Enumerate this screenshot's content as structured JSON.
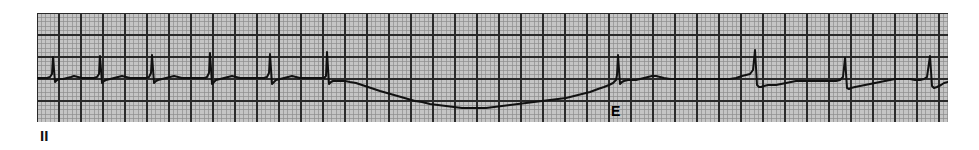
{
  "strip": {
    "lead_label": "II",
    "lead_label_x": 40,
    "lead_label_y": 128,
    "lead_label_size": 15,
    "width": 979,
    "height": 150,
    "background": "#ffffff"
  },
  "paper": {
    "x": 37,
    "y": 13,
    "width": 911,
    "height": 109,
    "paper_color": "#c5c5c5",
    "fine_line_color": "#8d8d8d",
    "heavy_line_color": "#2a2a2a",
    "fine_spacing": 4.4,
    "heavy_spacing": 22.0,
    "fine_line_width": 0.7,
    "heavy_line_width": 1.6,
    "trace_color": "#111111",
    "trace_width": 2.0
  },
  "annotations": [
    {
      "label": "E",
      "x": 611,
      "y": 104,
      "size": 14,
      "meaning": "escape-beat"
    }
  ],
  "chart_data": {
    "type": "line",
    "title": "",
    "xlabel": "",
    "ylabel": "",
    "lead": "II",
    "grid": true,
    "legend": "none",
    "paper_speed": "25 mm/s",
    "gain": "10 mm/mV",
    "xlim": [
      37,
      948
    ],
    "ylim": [
      13,
      122
    ],
    "baseline_y": 78,
    "rhythm_description": "Sinus beats followed by a long pause with downward baseline drift, terminated by a junctional escape beat (E), then resumption of beats",
    "beats": [
      {
        "x": 53,
        "type": "sinus",
        "r_peak_y": 57
      },
      {
        "x": 100,
        "type": "sinus",
        "r_peak_y": 56
      },
      {
        "x": 152,
        "type": "sinus",
        "r_peak_y": 55
      },
      {
        "x": 210,
        "type": "sinus",
        "r_peak_y": 53
      },
      {
        "x": 270,
        "type": "sinus",
        "r_peak_y": 54
      },
      {
        "x": 327,
        "type": "sinus",
        "r_peak_y": 52
      },
      {
        "x": 618,
        "type": "escape",
        "r_peak_y": 55
      },
      {
        "x": 755,
        "type": "sinus",
        "r_peak_y": 50
      },
      {
        "x": 845,
        "type": "sinus",
        "r_peak_y": 58
      },
      {
        "x": 930,
        "type": "sinus",
        "r_peak_y": 56
      }
    ],
    "trace_points": [
      [
        37,
        78
      ],
      [
        43,
        78
      ],
      [
        47,
        78
      ],
      [
        50,
        77
      ],
      [
        52,
        74
      ],
      [
        53,
        57
      ],
      [
        55,
        82
      ],
      [
        57,
        80
      ],
      [
        59,
        79
      ],
      [
        63,
        79
      ],
      [
        67,
        78
      ],
      [
        71,
        77
      ],
      [
        74,
        76
      ],
      [
        78,
        77
      ],
      [
        82,
        78
      ],
      [
        86,
        78
      ],
      [
        90,
        78
      ],
      [
        94,
        78
      ],
      [
        97,
        77
      ],
      [
        99,
        74
      ],
      [
        100,
        56
      ],
      [
        102,
        83
      ],
      [
        104,
        81
      ],
      [
        106,
        80
      ],
      [
        110,
        79
      ],
      [
        114,
        78
      ],
      [
        118,
        77
      ],
      [
        122,
        76
      ],
      [
        126,
        77
      ],
      [
        130,
        78
      ],
      [
        134,
        78
      ],
      [
        138,
        78
      ],
      [
        142,
        78
      ],
      [
        146,
        78
      ],
      [
        149,
        77
      ],
      [
        151,
        73
      ],
      [
        152,
        55
      ],
      [
        154,
        83
      ],
      [
        156,
        81
      ],
      [
        158,
        80
      ],
      [
        162,
        79
      ],
      [
        166,
        78
      ],
      [
        170,
        77
      ],
      [
        174,
        76
      ],
      [
        178,
        77
      ],
      [
        182,
        78
      ],
      [
        186,
        78
      ],
      [
        190,
        78
      ],
      [
        195,
        78
      ],
      [
        200,
        78
      ],
      [
        205,
        78
      ],
      [
        207,
        77
      ],
      [
        209,
        73
      ],
      [
        210,
        53
      ],
      [
        212,
        84
      ],
      [
        214,
        82
      ],
      [
        216,
        80
      ],
      [
        220,
        79
      ],
      [
        224,
        78
      ],
      [
        228,
        77
      ],
      [
        232,
        76
      ],
      [
        236,
        77
      ],
      [
        240,
        78
      ],
      [
        245,
        78
      ],
      [
        250,
        78
      ],
      [
        255,
        78
      ],
      [
        260,
        78
      ],
      [
        264,
        78
      ],
      [
        267,
        77
      ],
      [
        269,
        73
      ],
      [
        270,
        54
      ],
      [
        272,
        84
      ],
      [
        274,
        82
      ],
      [
        276,
        80
      ],
      [
        280,
        79
      ],
      [
        284,
        78
      ],
      [
        288,
        77
      ],
      [
        292,
        76
      ],
      [
        296,
        77
      ],
      [
        300,
        78
      ],
      [
        305,
        78
      ],
      [
        310,
        78
      ],
      [
        315,
        78
      ],
      [
        320,
        78
      ],
      [
        324,
        78
      ],
      [
        326,
        76
      ],
      [
        327,
        52
      ],
      [
        329,
        84
      ],
      [
        331,
        82
      ],
      [
        333,
        81
      ],
      [
        337,
        81
      ],
      [
        341,
        81
      ],
      [
        345,
        81
      ],
      [
        350,
        82
      ],
      [
        356,
        83
      ],
      [
        362,
        85
      ],
      [
        368,
        87
      ],
      [
        374,
        89
      ],
      [
        380,
        91
      ],
      [
        387,
        93
      ],
      [
        394,
        95
      ],
      [
        401,
        97
      ],
      [
        408,
        99
      ],
      [
        415,
        101
      ],
      [
        422,
        102
      ],
      [
        430,
        104
      ],
      [
        438,
        105
      ],
      [
        446,
        106
      ],
      [
        454,
        107
      ],
      [
        462,
        108
      ],
      [
        470,
        108
      ],
      [
        478,
        108
      ],
      [
        486,
        108
      ],
      [
        494,
        107
      ],
      [
        502,
        106
      ],
      [
        510,
        105
      ],
      [
        518,
        104
      ],
      [
        526,
        103
      ],
      [
        534,
        102
      ],
      [
        542,
        101
      ],
      [
        550,
        100
      ],
      [
        558,
        99
      ],
      [
        566,
        98
      ],
      [
        574,
        96
      ],
      [
        582,
        94
      ],
      [
        590,
        92
      ],
      [
        598,
        89
      ],
      [
        604,
        87
      ],
      [
        609,
        85
      ],
      [
        613,
        83
      ],
      [
        616,
        80
      ],
      [
        617,
        75
      ],
      [
        618,
        55
      ],
      [
        620,
        84
      ],
      [
        622,
        82
      ],
      [
        624,
        81
      ],
      [
        628,
        80
      ],
      [
        632,
        80
      ],
      [
        636,
        80
      ],
      [
        640,
        79
      ],
      [
        644,
        78
      ],
      [
        648,
        77
      ],
      [
        652,
        76
      ],
      [
        656,
        76
      ],
      [
        660,
        77
      ],
      [
        664,
        78
      ],
      [
        670,
        79
      ],
      [
        676,
        79
      ],
      [
        682,
        79
      ],
      [
        690,
        79
      ],
      [
        698,
        79
      ],
      [
        706,
        79
      ],
      [
        714,
        79
      ],
      [
        722,
        79
      ],
      [
        730,
        79
      ],
      [
        736,
        78
      ],
      [
        742,
        76
      ],
      [
        746,
        75
      ],
      [
        750,
        74
      ],
      [
        753,
        70
      ],
      [
        755,
        50
      ],
      [
        757,
        85
      ],
      [
        759,
        87
      ],
      [
        761,
        87
      ],
      [
        764,
        86
      ],
      [
        768,
        85
      ],
      [
        772,
        85
      ],
      [
        776,
        85
      ],
      [
        781,
        84
      ],
      [
        786,
        83
      ],
      [
        791,
        82
      ],
      [
        796,
        81
      ],
      [
        801,
        81
      ],
      [
        806,
        81
      ],
      [
        811,
        81
      ],
      [
        816,
        81
      ],
      [
        821,
        81
      ],
      [
        826,
        81
      ],
      [
        831,
        81
      ],
      [
        836,
        81
      ],
      [
        840,
        80
      ],
      [
        843,
        77
      ],
      [
        845,
        58
      ],
      [
        847,
        88
      ],
      [
        849,
        89
      ],
      [
        851,
        88
      ],
      [
        855,
        87
      ],
      [
        860,
        86
      ],
      [
        865,
        85
      ],
      [
        870,
        84
      ],
      [
        875,
        83
      ],
      [
        880,
        82
      ],
      [
        885,
        81
      ],
      [
        890,
        80
      ],
      [
        895,
        79
      ],
      [
        900,
        79
      ],
      [
        905,
        79
      ],
      [
        910,
        79
      ],
      [
        915,
        80
      ],
      [
        920,
        80
      ],
      [
        924,
        79
      ],
      [
        927,
        77
      ],
      [
        930,
        56
      ],
      [
        932,
        86
      ],
      [
        934,
        88
      ],
      [
        937,
        87
      ],
      [
        941,
        85
      ],
      [
        944,
        83
      ],
      [
        948,
        82
      ]
    ]
  }
}
